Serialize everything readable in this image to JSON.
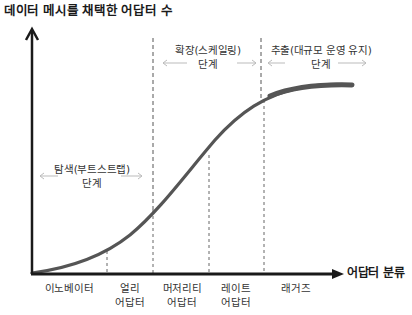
{
  "diagram": {
    "y_axis_label": "데이터 메시를 채택한 어답터 수",
    "x_axis_label": "어답터 분류",
    "colors": {
      "axis": "#1a1a1a",
      "curve": "#555555",
      "divider": "#555555",
      "phase_arrow": "#bbbbbb",
      "text": "#333333"
    },
    "phases": [
      {
        "name": "탐색(부트스트랩)",
        "suffix": "단계"
      },
      {
        "name": "확장(스케일링)",
        "suffix": "단계"
      },
      {
        "name": "추출(대규모 운영 유지)",
        "suffix": "단계"
      }
    ],
    "categories": [
      {
        "line1": "이노베이터",
        "line2": ""
      },
      {
        "line1": "얼리",
        "line2": "어답터"
      },
      {
        "line1": "머저리티",
        "line2": "어답터"
      },
      {
        "line1": "레이트",
        "line2": "어답터"
      },
      {
        "line1": "래거즈",
        "line2": ""
      }
    ]
  }
}
